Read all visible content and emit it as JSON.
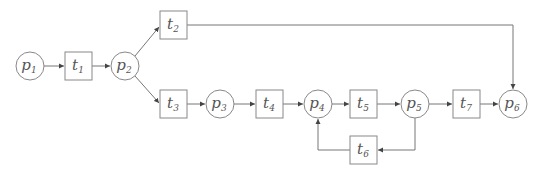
{
  "diagram": {
    "type": "petri-net",
    "places": [
      {
        "id": "p1",
        "base": "p",
        "sub": "1",
        "cx": 30,
        "cy": 66
      },
      {
        "id": "p2",
        "base": "p",
        "sub": "2",
        "cx": 125,
        "cy": 66
      },
      {
        "id": "p3",
        "base": "p",
        "sub": "3",
        "cx": 220,
        "cy": 104
      },
      {
        "id": "p4",
        "base": "p",
        "sub": "4",
        "cx": 318,
        "cy": 104
      },
      {
        "id": "p5",
        "base": "p",
        "sub": "5",
        "cx": 415,
        "cy": 104
      },
      {
        "id": "p6",
        "base": "p",
        "sub": "6",
        "cx": 513,
        "cy": 104
      }
    ],
    "transitions": [
      {
        "id": "t1",
        "base": "t",
        "sub": "1",
        "x": 65,
        "y": 52
      },
      {
        "id": "t2",
        "base": "t",
        "sub": "2",
        "x": 160,
        "y": 11
      },
      {
        "id": "t3",
        "base": "t",
        "sub": "3",
        "x": 160,
        "y": 90
      },
      {
        "id": "t4",
        "base": "t",
        "sub": "4",
        "x": 256,
        "y": 90
      },
      {
        "id": "t5",
        "base": "t",
        "sub": "5",
        "x": 350,
        "y": 90
      },
      {
        "id": "t6",
        "base": "t",
        "sub": "6",
        "x": 350,
        "y": 136
      },
      {
        "id": "t7",
        "base": "t",
        "sub": "7",
        "x": 453,
        "y": 90
      }
    ],
    "arcs": [
      {
        "from": "p1",
        "to": "t1"
      },
      {
        "from": "t1",
        "to": "p2"
      },
      {
        "from": "p2",
        "to": "t2"
      },
      {
        "from": "p2",
        "to": "t3"
      },
      {
        "from": "t2",
        "to": "p6"
      },
      {
        "from": "t3",
        "to": "p3"
      },
      {
        "from": "p3",
        "to": "t4"
      },
      {
        "from": "t4",
        "to": "p4"
      },
      {
        "from": "p4",
        "to": "t5"
      },
      {
        "from": "t5",
        "to": "p5"
      },
      {
        "from": "p5",
        "to": "t6"
      },
      {
        "from": "t6",
        "to": "p4"
      },
      {
        "from": "p5",
        "to": "t7"
      },
      {
        "from": "t7",
        "to": "p6"
      }
    ],
    "colors": {
      "stroke": "#888888",
      "text": "#555555",
      "background": "#ffffff"
    }
  }
}
